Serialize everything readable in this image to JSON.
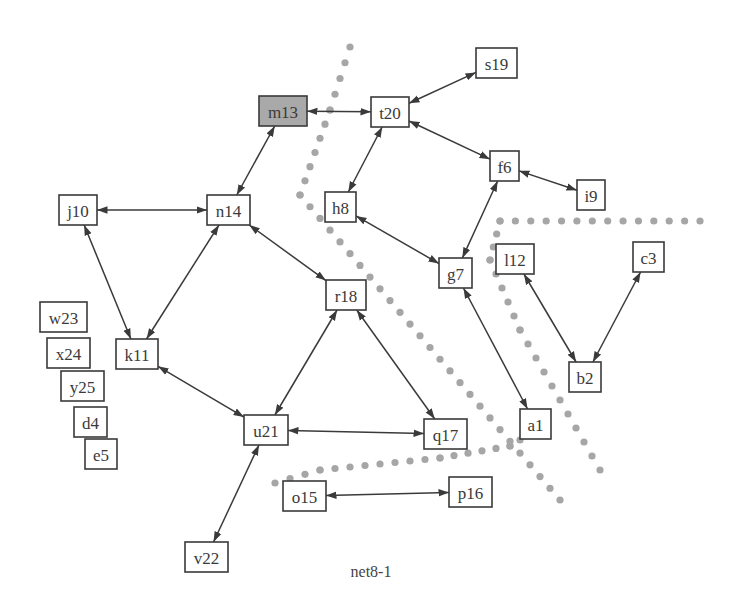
{
  "diagram": {
    "caption": "net8-1",
    "colors": {
      "stroke": "#3a3a3a",
      "highlight_fill": "#a9a9a9",
      "cut_dots": "#a6a6a6",
      "background": "#ffffff"
    },
    "nodes": [
      {
        "id": "m13",
        "label": "m13",
        "x": 259,
        "y": 96,
        "w": 48,
        "h": 30,
        "highlight": true
      },
      {
        "id": "t20",
        "label": "t20",
        "x": 371,
        "y": 97,
        "w": 38,
        "h": 30
      },
      {
        "id": "s19",
        "label": "s19",
        "x": 476,
        "y": 48,
        "w": 41,
        "h": 30
      },
      {
        "id": "f6",
        "label": "f6",
        "x": 490,
        "y": 151,
        "w": 29,
        "h": 30
      },
      {
        "id": "i9",
        "label": "i9",
        "x": 577,
        "y": 180,
        "w": 28,
        "h": 30
      },
      {
        "id": "j10",
        "label": "j10",
        "x": 59,
        "y": 195,
        "w": 38,
        "h": 30
      },
      {
        "id": "n14",
        "label": "n14",
        "x": 207,
        "y": 195,
        "w": 43,
        "h": 30
      },
      {
        "id": "h8",
        "label": "h8",
        "x": 325,
        "y": 192,
        "w": 31,
        "h": 30
      },
      {
        "id": "g7",
        "label": "g7",
        "x": 439,
        "y": 258,
        "w": 33,
        "h": 30
      },
      {
        "id": "l12",
        "label": "l12",
        "x": 496,
        "y": 244,
        "w": 38,
        "h": 30
      },
      {
        "id": "c3",
        "label": "c3",
        "x": 633,
        "y": 242,
        "w": 31,
        "h": 30
      },
      {
        "id": "r18",
        "label": "r18",
        "x": 326,
        "y": 280,
        "w": 40,
        "h": 30
      },
      {
        "id": "w23",
        "label": "w23",
        "x": 40,
        "y": 302,
        "w": 47,
        "h": 30
      },
      {
        "id": "x24",
        "label": "x24",
        "x": 47,
        "y": 338,
        "w": 43,
        "h": 30
      },
      {
        "id": "k11",
        "label": "k11",
        "x": 116,
        "y": 339,
        "w": 42,
        "h": 30
      },
      {
        "id": "y25",
        "label": "y25",
        "x": 61,
        "y": 371,
        "w": 43,
        "h": 30
      },
      {
        "id": "b2",
        "label": "b2",
        "x": 569,
        "y": 362,
        "w": 32,
        "h": 30
      },
      {
        "id": "d4",
        "label": "d4",
        "x": 74,
        "y": 407,
        "w": 33,
        "h": 30
      },
      {
        "id": "a1",
        "label": "a1",
        "x": 520,
        "y": 409,
        "w": 31,
        "h": 30
      },
      {
        "id": "u21",
        "label": "u21",
        "x": 244,
        "y": 415,
        "w": 44,
        "h": 30
      },
      {
        "id": "q17",
        "label": "q17",
        "x": 424,
        "y": 419,
        "w": 43,
        "h": 30
      },
      {
        "id": "e5",
        "label": "e5",
        "x": 85,
        "y": 439,
        "w": 32,
        "h": 30
      },
      {
        "id": "o15",
        "label": "o15",
        "x": 283,
        "y": 481,
        "w": 43,
        "h": 30
      },
      {
        "id": "p16",
        "label": "p16",
        "x": 449,
        "y": 477,
        "w": 43,
        "h": 30
      },
      {
        "id": "v22",
        "label": "v22",
        "x": 185,
        "y": 542,
        "w": 43,
        "h": 30
      }
    ],
    "edges": [
      {
        "from": "m13",
        "to": "t20"
      },
      {
        "from": "m13",
        "to": "n14"
      },
      {
        "from": "t20",
        "to": "s19"
      },
      {
        "from": "t20",
        "to": "f6"
      },
      {
        "from": "t20",
        "to": "h8"
      },
      {
        "from": "f6",
        "to": "i9"
      },
      {
        "from": "f6",
        "to": "g7"
      },
      {
        "from": "h8",
        "to": "g7"
      },
      {
        "from": "j10",
        "to": "n14"
      },
      {
        "from": "j10",
        "to": "k11"
      },
      {
        "from": "n14",
        "to": "k11"
      },
      {
        "from": "n14",
        "to": "r18"
      },
      {
        "from": "k11",
        "to": "u21"
      },
      {
        "from": "r18",
        "to": "u21"
      },
      {
        "from": "r18",
        "to": "q17"
      },
      {
        "from": "u21",
        "to": "q17"
      },
      {
        "from": "u21",
        "to": "v22"
      },
      {
        "from": "g7",
        "to": "a1"
      },
      {
        "from": "l12",
        "to": "b2"
      },
      {
        "from": "c3",
        "to": "b2"
      },
      {
        "from": "o15",
        "to": "p16"
      }
    ],
    "cut_lines": [
      {
        "name": "cut-line-1",
        "points": [
          [
            350,
            47
          ],
          [
            330,
            110
          ],
          [
            300,
            195
          ],
          [
            560,
            500
          ]
        ]
      },
      {
        "name": "cut-line-2",
        "points": [
          [
            700,
            221
          ],
          [
            500,
            221
          ],
          [
            490,
            260
          ],
          [
            520,
            330
          ],
          [
            600,
            470
          ]
        ]
      },
      {
        "name": "cut-line-3",
        "points": [
          [
            275,
            483
          ],
          [
            320,
            470
          ],
          [
            440,
            458
          ],
          [
            510,
            446
          ],
          [
            520,
            440
          ]
        ]
      }
    ]
  }
}
